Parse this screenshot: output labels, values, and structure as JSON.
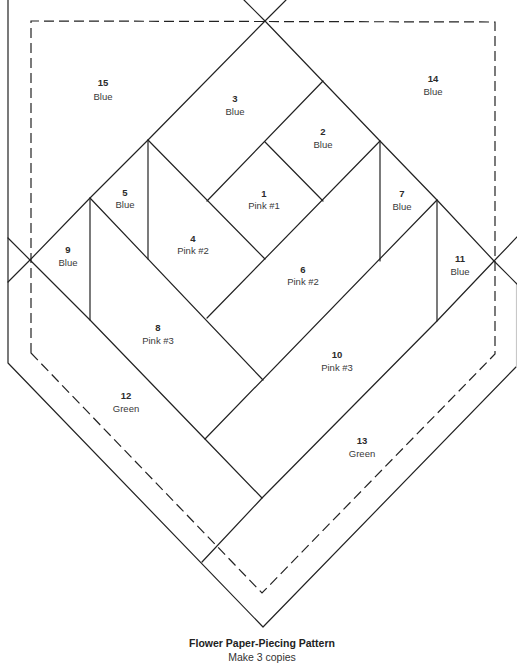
{
  "pattern": {
    "title": "Flower Paper-Piecing Pattern",
    "subtitle": "Make 3 copies",
    "pieces": [
      {
        "number": "1",
        "fabric": "Pink #1"
      },
      {
        "number": "2",
        "fabric": "Blue"
      },
      {
        "number": "3",
        "fabric": "Blue"
      },
      {
        "number": "4",
        "fabric": "Pink #2"
      },
      {
        "number": "5",
        "fabric": "Blue"
      },
      {
        "number": "6",
        "fabric": "Pink #2"
      },
      {
        "number": "7",
        "fabric": "Blue"
      },
      {
        "number": "8",
        "fabric": "Pink #3"
      },
      {
        "number": "9",
        "fabric": "Blue"
      },
      {
        "number": "10",
        "fabric": "Pink #3"
      },
      {
        "number": "11",
        "fabric": "Blue"
      },
      {
        "number": "12",
        "fabric": "Green"
      },
      {
        "number": "13",
        "fabric": "Green"
      },
      {
        "number": "14",
        "fabric": "Blue"
      },
      {
        "number": "15",
        "fabric": "Blue"
      }
    ]
  }
}
